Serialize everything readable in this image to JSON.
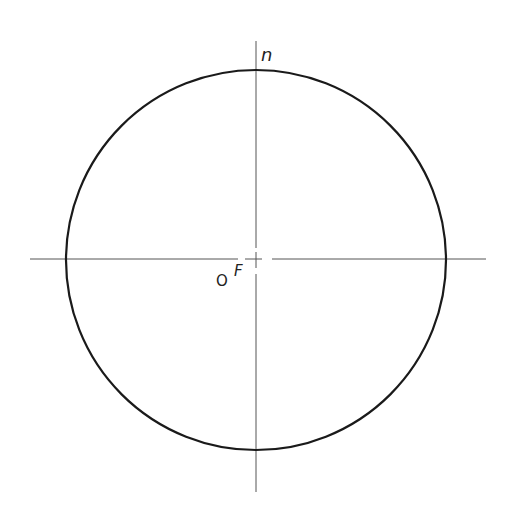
{
  "diagram": {
    "type": "circle-with-axes",
    "circle": {
      "cx": 256,
      "cy": 260,
      "r": 190,
      "stroke": "#1a1a1a"
    },
    "horizontal_axis": {
      "x1": 30,
      "x2": 486,
      "y": 259
    },
    "vertical_axis": {
      "x": 256,
      "y1": 41,
      "y2": 492
    },
    "labels": {
      "top": "n",
      "center_o": "O",
      "center_f": "F"
    }
  }
}
